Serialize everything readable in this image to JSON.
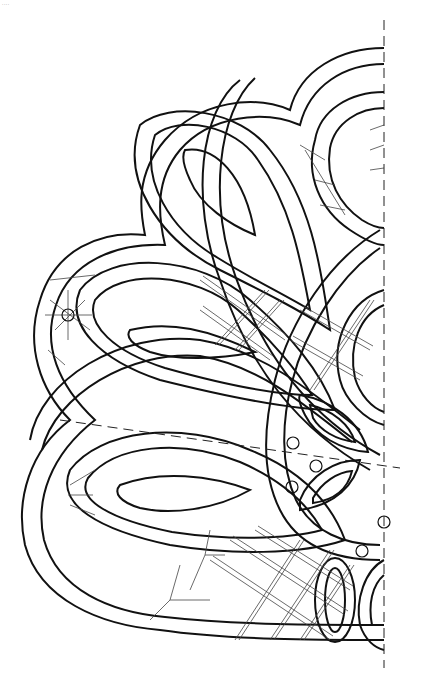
{
  "diagram": {
    "corner_mark": "....",
    "stroke_color": "#111111",
    "thin_color": "#333333",
    "background": "#ffffff",
    "axis_line": {
      "x": 384,
      "y1": 20,
      "y2": 668
    },
    "center_line": {
      "x1": 60,
      "y1": 420,
      "x2": 400,
      "y2": 468
    },
    "markers": [
      {
        "name": "left-pin-marker",
        "x": 48,
        "y": 423
      },
      {
        "name": "right-pin-marker",
        "x": 402,
        "y": 470
      }
    ],
    "pin_circles": [
      {
        "cx": 68,
        "cy": 315,
        "r": 6
      },
      {
        "cx": 293,
        "cy": 443,
        "r": 6
      },
      {
        "cx": 316,
        "cy": 466,
        "r": 6
      },
      {
        "cx": 292,
        "cy": 487,
        "r": 6
      },
      {
        "cx": 386,
        "cy": 522,
        "r": 6
      },
      {
        "cx": 362,
        "cy": 551,
        "r": 6
      },
      {
        "cx": 384,
        "cy": 525,
        "r": 0
      }
    ]
  }
}
